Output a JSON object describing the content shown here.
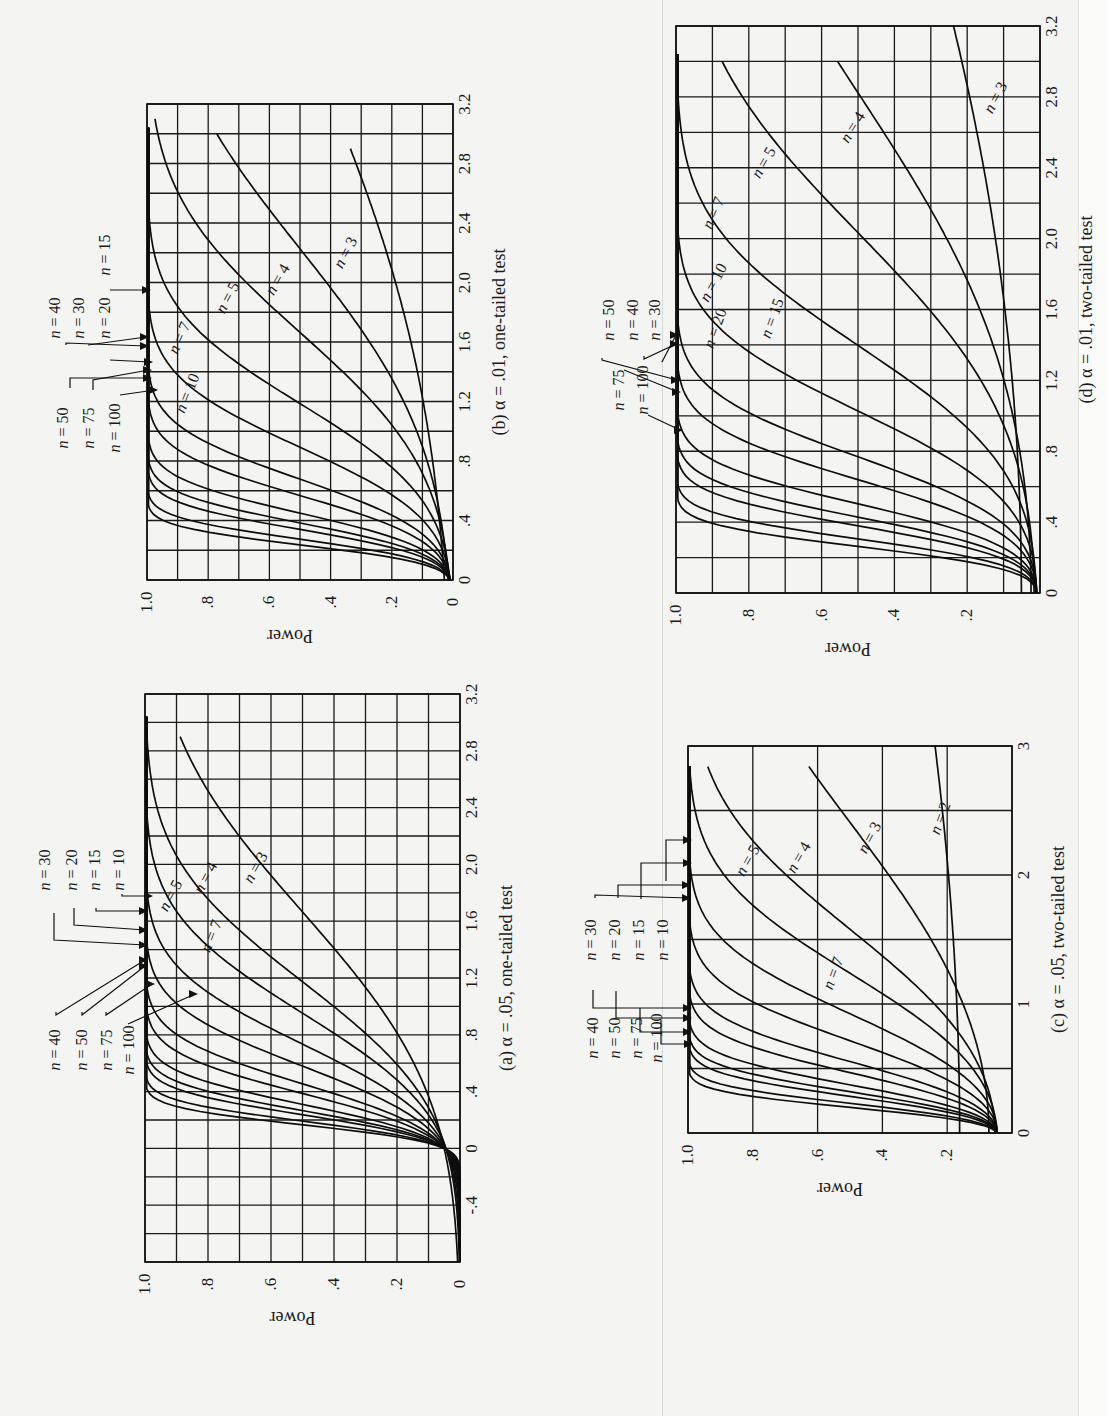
{
  "panels": {
    "a": {
      "caption": "(a) α = .05, one-tailed test",
      "ylabel": "Power",
      "x_ticks": [
        "-.4",
        "0",
        ".4",
        ".8",
        "1.2",
        "1.6",
        "2.0",
        "2.4",
        "2.8",
        "3.2"
      ],
      "y_ticks": [
        "0",
        ".2",
        ".4",
        ".6",
        ".8",
        "1.0"
      ],
      "legend_left": [
        "n = 40",
        "n = 50",
        "n = 75",
        "n = 100"
      ],
      "legend_right": [
        "n = 30",
        "n = 20",
        "n = 15",
        "n = 10"
      ],
      "inline_labels": [
        "n = 3",
        "n = 4",
        "n = 5",
        "n = 7"
      ]
    },
    "b": {
      "caption": "(b) α = .01, one-tailed test",
      "ylabel": "Power",
      "x_ticks": [
        "0",
        ".4",
        ".8",
        "1.2",
        "1.6",
        "2.0",
        "2.4",
        "2.8",
        "3.2"
      ],
      "y_ticks": [
        "0",
        ".2",
        ".4",
        ".6",
        ".8",
        "1.0"
      ],
      "legend_left": [
        "n = 50",
        "n = 75",
        "n = 100"
      ],
      "legend_right": [
        "n = 40",
        "n = 30",
        "n = 20",
        "n = 15"
      ],
      "inline_labels": [
        "n = 3",
        "n = 4",
        "n = 5",
        "n = 7",
        "n = 10"
      ]
    },
    "c": {
      "caption": "(c) α = .05, two-tailed test",
      "ylabel": "Power",
      "x_ticks": [
        "0",
        "1",
        "2",
        "3"
      ],
      "y_ticks": [
        ".2",
        ".4",
        ".6",
        ".8",
        "1.0"
      ],
      "legend_left": [
        "n = 40",
        "n = 50",
        "n = 75",
        "n = 100"
      ],
      "legend_right": [
        "n = 30",
        "n = 20",
        "n = 15",
        "n = 10"
      ],
      "inline_labels": [
        "n = 2",
        "n = 3",
        "n = 4",
        "n = 5",
        "n = 7"
      ]
    },
    "d": {
      "caption": "(d) α = .01, two-tailed test",
      "ylabel": "Power",
      "x_ticks": [
        "0",
        ".4",
        ".8",
        "1.2",
        "1.6",
        "2.0",
        "2.4",
        "2.8",
        "3.2"
      ],
      "y_ticks": [
        ".2",
        ".4",
        ".6",
        ".8",
        "1.0"
      ],
      "legend_left": [
        "n = 75",
        "n = 100"
      ],
      "legend_right": [
        "n = 50",
        "n = 40",
        "n = 30"
      ],
      "inline_labels": [
        "n = 3",
        "n = 4",
        "n = 5",
        "n = 7",
        "n = 10",
        "n = 15",
        "n = 20"
      ]
    }
  },
  "chart_data": [
    {
      "id": "a",
      "type": "line",
      "title": "(a) α = .05, one-tailed test",
      "xlabel": "d (standardized effect size)",
      "ylabel": "Power",
      "xlim": [
        -0.8,
        3.2
      ],
      "ylim": [
        0,
        1.0
      ],
      "grid": true,
      "x": [
        -0.8,
        -0.4,
        0,
        0.2,
        0.4,
        0.8,
        1.2,
        1.6,
        2.0,
        2.4,
        2.8,
        3.0
      ],
      "series": [
        {
          "name": "n = 3",
          "values": [
            0.0,
            0.01,
            0.05,
            0.1,
            0.17,
            0.33,
            0.5,
            0.65,
            0.77,
            0.86,
            0.92,
            0.94
          ]
        },
        {
          "name": "n = 4",
          "values": [
            0.0,
            0.01,
            0.05,
            0.12,
            0.22,
            0.44,
            0.66,
            0.82,
            0.92,
            0.97,
            0.99,
            0.99
          ]
        },
        {
          "name": "n = 5",
          "values": [
            0.0,
            0.0,
            0.05,
            0.13,
            0.26,
            0.54,
            0.78,
            0.91,
            0.97,
            0.99,
            1.0,
            1.0
          ]
        },
        {
          "name": "n = 7",
          "values": [
            0.0,
            0.0,
            0.05,
            0.15,
            0.32,
            0.69,
            0.91,
            0.98,
            1.0,
            1.0,
            1.0,
            1.0
          ]
        },
        {
          "name": "n = 10",
          "values": [
            0.0,
            0.0,
            0.05,
            0.18,
            0.41,
            0.84,
            0.98,
            1.0,
            1.0,
            1.0,
            1.0,
            1.0
          ]
        },
        {
          "name": "n = 15",
          "values": [
            0.0,
            0.0,
            0.05,
            0.22,
            0.54,
            0.95,
            1.0,
            1.0,
            1.0,
            1.0,
            1.0,
            1.0
          ]
        },
        {
          "name": "n = 20",
          "values": [
            0.0,
            0.0,
            0.05,
            0.26,
            0.65,
            0.99,
            1.0,
            1.0,
            1.0,
            1.0,
            1.0,
            1.0
          ]
        },
        {
          "name": "n = 30",
          "values": [
            0.0,
            0.0,
            0.05,
            0.33,
            0.8,
            1.0,
            1.0,
            1.0,
            1.0,
            1.0,
            1.0,
            1.0
          ]
        },
        {
          "name": "n = 40",
          "values": [
            0.0,
            0.0,
            0.05,
            0.4,
            0.89,
            1.0,
            1.0,
            1.0,
            1.0,
            1.0,
            1.0,
            1.0
          ]
        },
        {
          "name": "n = 50",
          "values": [
            0.0,
            0.0,
            0.05,
            0.46,
            0.94,
            1.0,
            1.0,
            1.0,
            1.0,
            1.0,
            1.0,
            1.0
          ]
        },
        {
          "name": "n = 75",
          "values": [
            0.0,
            0.0,
            0.05,
            0.61,
            0.99,
            1.0,
            1.0,
            1.0,
            1.0,
            1.0,
            1.0,
            1.0
          ]
        },
        {
          "name": "n = 100",
          "values": [
            0.0,
            0.0,
            0.05,
            0.72,
            1.0,
            1.0,
            1.0,
            1.0,
            1.0,
            1.0,
            1.0,
            1.0
          ]
        }
      ]
    },
    {
      "id": "b",
      "type": "line",
      "title": "(b) α = .01, one-tailed test",
      "xlabel": "d (standardized effect size)",
      "ylabel": "Power",
      "xlim": [
        0,
        3.2
      ],
      "ylim": [
        0,
        1.0
      ],
      "grid": true,
      "x": [
        0,
        0.2,
        0.4,
        0.8,
        1.2,
        1.6,
        2.0,
        2.4,
        2.8,
        3.0
      ],
      "series": [
        {
          "name": "n = 3",
          "values": [
            0.01,
            0.02,
            0.03,
            0.07,
            0.12,
            0.19,
            0.26,
            0.34,
            0.42,
            0.46
          ]
        },
        {
          "name": "n = 4",
          "values": [
            0.01,
            0.02,
            0.04,
            0.1,
            0.2,
            0.33,
            0.48,
            0.62,
            0.74,
            0.8
          ]
        },
        {
          "name": "n = 5",
          "values": [
            0.01,
            0.02,
            0.05,
            0.15,
            0.32,
            0.52,
            0.71,
            0.85,
            0.94,
            0.99
          ]
        },
        {
          "name": "n = 7",
          "values": [
            0.01,
            0.03,
            0.07,
            0.26,
            0.55,
            0.81,
            0.95,
            0.99,
            1.0,
            1.0
          ]
        },
        {
          "name": "n = 10",
          "values": [
            0.01,
            0.04,
            0.1,
            0.42,
            0.8,
            0.97,
            1.0,
            1.0,
            1.0,
            1.0
          ]
        },
        {
          "name": "n = 15",
          "values": [
            0.01,
            0.05,
            0.16,
            0.65,
            0.96,
            1.0,
            1.0,
            1.0,
            1.0,
            1.0
          ]
        },
        {
          "name": "n = 20",
          "values": [
            0.01,
            0.06,
            0.22,
            0.81,
            0.99,
            1.0,
            1.0,
            1.0,
            1.0,
            1.0
          ]
        },
        {
          "name": "n = 30",
          "values": [
            0.01,
            0.08,
            0.37,
            0.96,
            1.0,
            1.0,
            1.0,
            1.0,
            1.0,
            1.0
          ]
        },
        {
          "name": "n = 40",
          "values": [
            0.01,
            0.11,
            0.51,
            0.99,
            1.0,
            1.0,
            1.0,
            1.0,
            1.0,
            1.0
          ]
        },
        {
          "name": "n = 50",
          "values": [
            0.01,
            0.14,
            0.63,
            1.0,
            1.0,
            1.0,
            1.0,
            1.0,
            1.0,
            1.0
          ]
        },
        {
          "name": "n = 75",
          "values": [
            0.01,
            0.23,
            0.85,
            1.0,
            1.0,
            1.0,
            1.0,
            1.0,
            1.0,
            1.0
          ]
        },
        {
          "name": "n = 100",
          "values": [
            0.01,
            0.32,
            0.95,
            1.0,
            1.0,
            1.0,
            1.0,
            1.0,
            1.0,
            1.0
          ]
        }
      ]
    },
    {
      "id": "c",
      "type": "line",
      "title": "(c) α = .05, two-tailed test",
      "xlabel": "d (standardized effect size)",
      "ylabel": "Power",
      "xlim": [
        0,
        3
      ],
      "ylim": [
        0,
        1.0
      ],
      "grid": true,
      "x": [
        0,
        0.25,
        0.5,
        1.0,
        1.5,
        2.0,
        2.5,
        3.0
      ],
      "series": [
        {
          "name": "n = 2",
          "values": [
            0.05,
            0.05,
            0.06,
            0.08,
            0.11,
            0.14,
            0.17,
            0.2
          ]
        },
        {
          "name": "n = 3",
          "values": [
            0.05,
            0.06,
            0.08,
            0.18,
            0.32,
            0.47,
            0.61,
            0.72
          ]
        },
        {
          "name": "n = 4",
          "values": [
            0.05,
            0.07,
            0.11,
            0.3,
            0.55,
            0.76,
            0.9,
            0.96
          ]
        },
        {
          "name": "n = 5",
          "values": [
            0.05,
            0.08,
            0.14,
            0.4,
            0.72,
            0.91,
            0.98,
            1.0
          ]
        },
        {
          "name": "n = 7",
          "values": [
            0.05,
            0.09,
            0.2,
            0.59,
            0.91,
            0.99,
            1.0,
            1.0
          ]
        },
        {
          "name": "n = 10",
          "values": [
            0.05,
            0.11,
            0.29,
            0.8,
            0.99,
            1.0,
            1.0,
            1.0
          ]
        },
        {
          "name": "n = 15",
          "values": [
            0.05,
            0.15,
            0.43,
            0.95,
            1.0,
            1.0,
            1.0,
            1.0
          ]
        },
        {
          "name": "n = 20",
          "values": [
            0.05,
            0.19,
            0.56,
            0.99,
            1.0,
            1.0,
            1.0,
            1.0
          ]
        },
        {
          "name": "n = 30",
          "values": [
            0.05,
            0.26,
            0.75,
            1.0,
            1.0,
            1.0,
            1.0,
            1.0
          ]
        },
        {
          "name": "n = 40",
          "values": [
            0.05,
            0.34,
            0.87,
            1.0,
            1.0,
            1.0,
            1.0,
            1.0
          ]
        },
        {
          "name": "n = 50",
          "values": [
            0.05,
            0.41,
            0.93,
            1.0,
            1.0,
            1.0,
            1.0,
            1.0
          ]
        },
        {
          "name": "n = 75",
          "values": [
            0.05,
            0.57,
            0.99,
            1.0,
            1.0,
            1.0,
            1.0,
            1.0
          ]
        },
        {
          "name": "n = 100",
          "values": [
            0.05,
            0.7,
            1.0,
            1.0,
            1.0,
            1.0,
            1.0,
            1.0
          ]
        }
      ]
    },
    {
      "id": "d",
      "type": "line",
      "title": "(d) α = .01, two-tailed test",
      "xlabel": "d (standardized effect size)",
      "ylabel": "Power",
      "xlim": [
        0,
        3.2
      ],
      "ylim": [
        0,
        1.0
      ],
      "grid": true,
      "x": [
        0,
        0.2,
        0.4,
        0.8,
        1.2,
        1.6,
        2.0,
        2.4,
        2.8,
        3.2
      ],
      "series": [
        {
          "name": "n = 3",
          "values": [
            0.01,
            0.01,
            0.02,
            0.03,
            0.06,
            0.09,
            0.13,
            0.17,
            0.21,
            0.25
          ]
        },
        {
          "name": "n = 4",
          "values": [
            0.01,
            0.01,
            0.02,
            0.06,
            0.12,
            0.21,
            0.32,
            0.44,
            0.56,
            0.66
          ]
        },
        {
          "name": "n = 5",
          "values": [
            0.01,
            0.02,
            0.03,
            0.09,
            0.2,
            0.36,
            0.54,
            0.7,
            0.83,
            0.91
          ]
        },
        {
          "name": "n = 7",
          "values": [
            0.01,
            0.02,
            0.04,
            0.16,
            0.39,
            0.65,
            0.85,
            0.95,
            0.99,
            1.0
          ]
        },
        {
          "name": "n = 10",
          "values": [
            0.01,
            0.02,
            0.06,
            0.29,
            0.65,
            0.9,
            0.99,
            1.0,
            1.0,
            1.0
          ]
        },
        {
          "name": "n = 15",
          "values": [
            0.01,
            0.03,
            0.1,
            0.5,
            0.89,
            0.99,
            1.0,
            1.0,
            1.0,
            1.0
          ]
        },
        {
          "name": "n = 20",
          "values": [
            0.01,
            0.04,
            0.14,
            0.68,
            0.97,
            1.0,
            1.0,
            1.0,
            1.0,
            1.0
          ]
        },
        {
          "name": "n = 30",
          "values": [
            0.01,
            0.05,
            0.25,
            0.89,
            1.0,
            1.0,
            1.0,
            1.0,
            1.0,
            1.0
          ]
        },
        {
          "name": "n = 40",
          "values": [
            0.01,
            0.07,
            0.37,
            0.97,
            1.0,
            1.0,
            1.0,
            1.0,
            1.0,
            1.0
          ]
        },
        {
          "name": "n = 50",
          "values": [
            0.01,
            0.09,
            0.49,
            0.99,
            1.0,
            1.0,
            1.0,
            1.0,
            1.0,
            1.0
          ]
        },
        {
          "name": "n = 75",
          "values": [
            0.01,
            0.16,
            0.75,
            1.0,
            1.0,
            1.0,
            1.0,
            1.0,
            1.0,
            1.0
          ]
        },
        {
          "name": "n = 100",
          "values": [
            0.01,
            0.24,
            0.9,
            1.0,
            1.0,
            1.0,
            1.0,
            1.0,
            1.0,
            1.0
          ]
        }
      ]
    }
  ]
}
